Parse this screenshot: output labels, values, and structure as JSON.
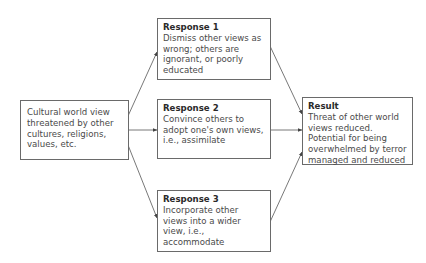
{
  "diagram": {
    "source": {
      "text": "Cultural world view threatened by other cultures, religions, values, etc."
    },
    "responses": [
      {
        "title": "Response 1",
        "text": "Dismiss other views as wrong; others are ignorant, or poorly educated"
      },
      {
        "title": "Response 2",
        "text": "Convince others to adopt one's own views, i.e., assimilate"
      },
      {
        "title": "Response 3",
        "text": "Incorporate other views into a wider view, i.e., accommodate"
      }
    ],
    "result": {
      "title": "Result",
      "text": "Threat of other world views reduced. Potential for being overwhelmed by terror managed and reduced"
    },
    "colors": {
      "line": "#555555",
      "border": "#6a6a6a",
      "text": "#4a4a4a"
    }
  }
}
